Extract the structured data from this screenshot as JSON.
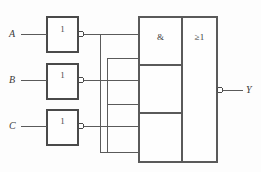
{
  "diagram": {
    "background_color": "#fdfdfd",
    "line_color": "#5a5a5a",
    "text_color": "#3a3a3a",
    "inputs": [
      {
        "label": "A",
        "name": "input-a"
      },
      {
        "label": "B",
        "name": "input-b"
      },
      {
        "label": "C",
        "name": "input-c"
      }
    ],
    "inverters": [
      {
        "symbol": "1",
        "name": "inverter-a",
        "inverted_output": true
      },
      {
        "symbol": "1",
        "name": "inverter-b",
        "inverted_output": true
      },
      {
        "symbol": "1",
        "name": "inverter-c",
        "inverted_output": true
      }
    ],
    "and_block": {
      "symbol": "&",
      "name": "and-gate-block",
      "sections": 3
    },
    "or_block": {
      "symbol": "≥1",
      "name": "or-gate-block",
      "inverted_output": true
    },
    "output": {
      "label": "Y",
      "name": "output-y"
    }
  }
}
